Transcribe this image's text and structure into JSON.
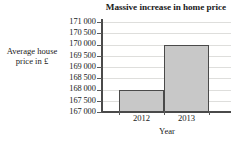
{
  "chart_data": {
    "type": "bar",
    "title": "Massive increase in home price",
    "xlabel": "Year",
    "ylabel_line1": "Average house",
    "ylabel_line2": "price in £",
    "categories": [
      "2012",
      "2013"
    ],
    "values": [
      168000,
      170000
    ],
    "ylim": [
      167000,
      171000
    ],
    "ytick_step": 500,
    "ytick_labels": [
      "171 000",
      "170 500",
      "170 000",
      "169 500",
      "169 000",
      "168 500",
      "168 000",
      "167 500",
      "167 000"
    ],
    "ytick_values": [
      171000,
      170500,
      170000,
      169500,
      169000,
      168500,
      168000,
      167500,
      167000
    ],
    "grid": true,
    "legend": false,
    "bar_fill": "#c8c8c8",
    "bar_edge": "#4a4a4a",
    "grid_color": "#dededc",
    "axis_color": "#4a4a4a"
  }
}
